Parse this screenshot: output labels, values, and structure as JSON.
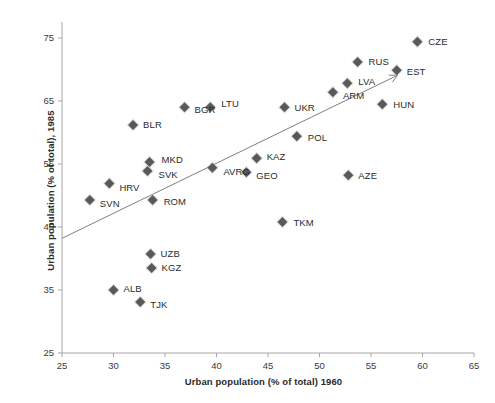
{
  "chart_data": {
    "type": "scatter",
    "title": "",
    "xlabel": "Urban population (% of total) 1960",
    "ylabel": "Urban population (% of total), 1985",
    "xlim": [
      25,
      65
    ],
    "ylim": [
      25,
      80
    ],
    "xticks": [
      25,
      30,
      35,
      40,
      45,
      50,
      55,
      60,
      65
    ],
    "yticks": [
      25,
      35,
      45,
      55,
      65,
      75
    ],
    "grid": false,
    "legend": "none",
    "marker": {
      "shape": "diamond",
      "color": "#595959",
      "size": 7
    },
    "trendline": {
      "show": true,
      "color": "#7f7f7f",
      "x_start": 25.0,
      "y_start": 43.2,
      "x_end": 57.6,
      "y_end": 69.1
    },
    "points": [
      {
        "label": "SVN",
        "x": 27.7,
        "y": 49.3,
        "label_dx": 10,
        "label_dy": 4
      },
      {
        "label": "HRV",
        "x": 29.6,
        "y": 51.9,
        "label_dx": 10,
        "label_dy": 4
      },
      {
        "label": "ALB",
        "x": 30.0,
        "y": 35.0,
        "label_dx": 10,
        "label_dy": -1
      },
      {
        "label": "BLR",
        "x": 31.9,
        "y": 61.2,
        "label_dx": 10,
        "label_dy": 0
      },
      {
        "label": "TJK",
        "x": 32.6,
        "y": 33.1,
        "label_dx": 10,
        "label_dy": 3
      },
      {
        "label": "SVK",
        "x": 33.3,
        "y": 53.9,
        "label_dx": 11,
        "label_dy": 4
      },
      {
        "label": "MKD",
        "x": 33.5,
        "y": 55.3,
        "label_dx": 12,
        "label_dy": -2
      },
      {
        "label": "UZB",
        "x": 33.6,
        "y": 40.7,
        "label_dx": 10,
        "label_dy": 0
      },
      {
        "label": "KGZ",
        "x": 33.7,
        "y": 38.5,
        "label_dx": 10,
        "label_dy": 0
      },
      {
        "label": "ROM",
        "x": 33.8,
        "y": 49.3,
        "label_dx": 11,
        "label_dy": 2
      },
      {
        "label": "BGR",
        "x": 36.9,
        "y": 64.0,
        "label_dx": 10,
        "label_dy": 3
      },
      {
        "label": "LTU",
        "x": 39.4,
        "y": 64.0,
        "label_dx": 11,
        "label_dy": -3
      },
      {
        "label": "AVRG",
        "x": 39.6,
        "y": 54.4,
        "label_dx": 11,
        "label_dy": 4
      },
      {
        "label": "GEO",
        "x": 42.9,
        "y": 53.7,
        "label_dx": 10,
        "label_dy": 4
      },
      {
        "label": "KAZ",
        "x": 43.9,
        "y": 55.9,
        "label_dx": 10,
        "label_dy": -1
      },
      {
        "label": "TKM",
        "x": 46.4,
        "y": 45.8,
        "label_dx": 11,
        "label_dy": 1
      },
      {
        "label": "UKR",
        "x": 46.6,
        "y": 64.0,
        "label_dx": 10,
        "label_dy": 1
      },
      {
        "label": "POL",
        "x": 47.8,
        "y": 59.4,
        "label_dx": 11,
        "label_dy": 2
      },
      {
        "label": "ARM",
        "x": 51.3,
        "y": 66.4,
        "label_dx": 10,
        "label_dy": 4
      },
      {
        "label": "LVA",
        "x": 52.7,
        "y": 67.8,
        "label_dx": 11,
        "label_dy": -1
      },
      {
        "label": "AZE",
        "x": 52.8,
        "y": 53.2,
        "label_dx": 10,
        "label_dy": 1
      },
      {
        "label": "RUS",
        "x": 53.7,
        "y": 71.2,
        "label_dx": 11,
        "label_dy": 0
      },
      {
        "label": "HUN",
        "x": 56.1,
        "y": 64.5,
        "label_dx": 11,
        "label_dy": 1
      },
      {
        "label": "EST",
        "x": 57.5,
        "y": 69.9,
        "label_dx": 10,
        "label_dy": 2
      },
      {
        "label": "CZE",
        "x": 59.5,
        "y": 74.4,
        "label_dx": 11,
        "label_dy": 0
      }
    ]
  },
  "axes": {
    "x_title": "Urban population (% of total) 1960",
    "y_title": "Urban population (% of total), 1985",
    "x_tick_labels": [
      "25",
      "30",
      "35",
      "40",
      "45",
      "50",
      "55",
      "60",
      "65"
    ],
    "y_tick_labels": [
      "75",
      "65",
      "55",
      "45",
      "35",
      "25"
    ]
  },
  "colors": {
    "marker": "#595959",
    "trendline": "#8c8c8c",
    "axis": "#a6a6a6",
    "text": "#2b2b2b",
    "background": "#ffffff"
  }
}
